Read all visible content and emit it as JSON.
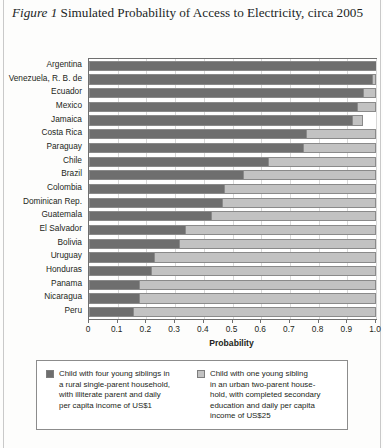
{
  "figure": {
    "label": "Figure 1",
    "title_text": " Simulated Probability of Access to Electricity, circa 2005"
  },
  "colors": {
    "dark_series": "#6e6e6e",
    "light_series": "#c2c2c2",
    "axis": "#6f6f6f",
    "gridline": "#d8d8d8",
    "text": "#231f20"
  },
  "axis": {
    "x_title": "Probability",
    "x_ticks": [
      "0",
      "0.1",
      "0.2",
      "0.3",
      "0.4",
      "0.5",
      "0.6",
      "0.7",
      "0.8",
      "0.9",
      "1.0"
    ],
    "x_min": 0,
    "x_max": 1.0
  },
  "legend": {
    "items": [
      {
        "swatch": "dark",
        "lines": [
          "Child with four young siblings in",
          "a rural single-parent household,",
          "with illiterate parent and daily",
          "per capita income of US$1"
        ]
      },
      {
        "swatch": "light",
        "lines": [
          "Child with one young sibling",
          "in an urban two-parent house-",
          "hold, with completed secondary",
          "education and daily per capita",
          "income of US$25"
        ]
      }
    ]
  },
  "chart_data": {
    "type": "bar",
    "orientation": "horizontal",
    "stacked": true,
    "title": "Figure 1 Simulated Probability of Access to Electricity, circa 2005",
    "xlabel": "Probability",
    "ylabel": "",
    "xlim": [
      0,
      1.0
    ],
    "grid": true,
    "legend_position": "bottom",
    "categories": [
      "Argentina",
      "Venezuela, R. B. de",
      "Ecuador",
      "Mexico",
      "Jamaica",
      "Costa Rica",
      "Paraguay",
      "Chile",
      "Brazil",
      "Colombia",
      "Dominican Rep.",
      "Guatemala",
      "El Salvador",
      "Bolivia",
      "Uruguay",
      "Honduras",
      "Panama",
      "Nicaragua",
      "Peru"
    ],
    "series": [
      {
        "name": "Child with four young siblings in a rural single-parent household, with illiterate parent and daily per capita income of US$1",
        "color": "#6e6e6e",
        "values": [
          1.0,
          0.985,
          0.955,
          0.935,
          0.915,
          0.755,
          0.745,
          0.625,
          0.535,
          0.47,
          0.465,
          0.425,
          0.335,
          0.315,
          0.225,
          0.215,
          0.175,
          0.175,
          0.155
        ]
      },
      {
        "name": "Child with one young sibling in an urban two-parent household, with completed secondary education and daily per capita income of US$25",
        "color": "#c2c2c2",
        "values": [
          1.0,
          1.0,
          1.0,
          1.0,
          0.955,
          1.0,
          1.0,
          1.0,
          1.0,
          1.0,
          1.0,
          1.0,
          1.0,
          1.0,
          1.0,
          1.0,
          1.0,
          1.0,
          1.0
        ]
      }
    ]
  }
}
